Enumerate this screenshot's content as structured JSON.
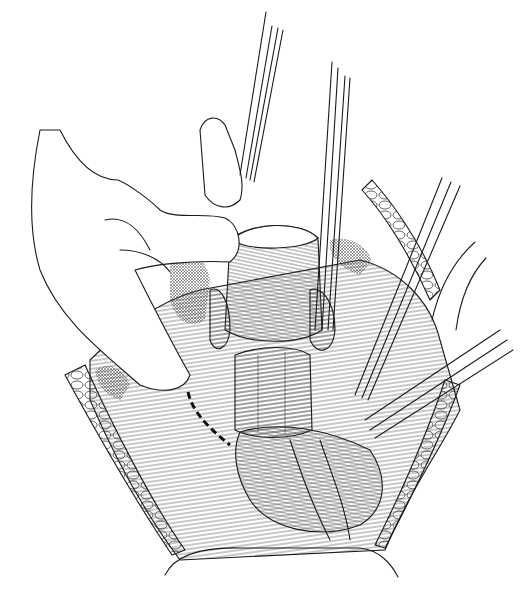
{
  "illustration": {
    "kind": "surgical line drawing",
    "style": "black ink on white",
    "colors": {
      "ink": "#1a1a1a",
      "background": "#ffffff"
    },
    "elements": [
      "surgeon-hand",
      "retractor-left",
      "forceps-center",
      "forceps-right",
      "retractor-right-lower",
      "uterus",
      "tissue-bundle",
      "bowel",
      "incision-dashed-line",
      "wound-edges"
    ]
  }
}
